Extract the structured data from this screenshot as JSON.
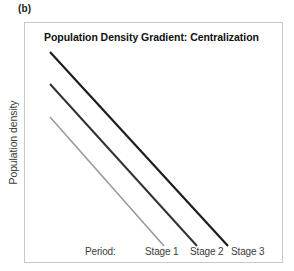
{
  "panel": {
    "letter": "(b)"
  },
  "chart": {
    "title": "Population Density Gradient: Centralization",
    "y_axis_label": "Population density",
    "period_label": "Period:",
    "stage_labels": [
      "Stage 1",
      "Stage 2",
      "Stage 3"
    ]
  },
  "chart_data": {
    "type": "line",
    "title": "Population Density Gradient: Centralization",
    "subtitle": "",
    "xlabel": "Period:",
    "ylabel": "Population density",
    "grid": false,
    "legend": "none",
    "axis_ticks_shown": false,
    "axis_values_shown": false,
    "xlim": [
      0,
      259
    ],
    "ylim": [
      0,
      241
    ],
    "annotations": [
      "Period:",
      "Stage 1",
      "Stage 2",
      "Stage 3"
    ],
    "series": [
      {
        "name": "Stage 1",
        "color": "#9a9a9a",
        "width": 1.6,
        "x": [
          26,
          140
        ],
        "y": [
          95,
          224
        ],
        "note": "lightest grey, shortest line, lowest intercept"
      },
      {
        "name": "Stage 2",
        "color": "#333333",
        "width": 2.0,
        "x": [
          26,
          173
        ],
        "y": [
          62,
          224
        ],
        "note": "dark grey, middle intercept"
      },
      {
        "name": "Stage 3",
        "color": "#1d1d1d",
        "width": 2.2,
        "x": [
          26,
          204
        ],
        "y": [
          30,
          224
        ],
        "note": "darkest, longest line, highest intercept"
      }
    ]
  },
  "colors": {
    "frame": "#c9c9c9",
    "title": "#111111",
    "text": "#3c3c3c",
    "background": "#ffffff"
  }
}
